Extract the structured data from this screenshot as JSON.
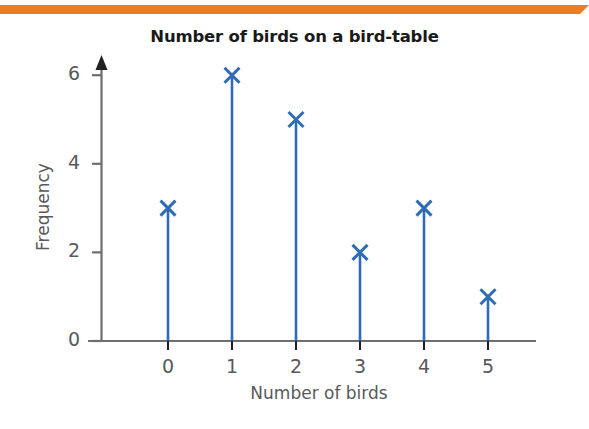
{
  "decoration": {
    "top_band_color": "#F07C22"
  },
  "chart_data": {
    "type": "bar",
    "variant": "vertical-line-with-x-markers",
    "title": "Number of birds on a bird-table",
    "xlabel": "Number of birds",
    "ylabel": "Frequency",
    "categories": [
      "0",
      "1",
      "2",
      "3",
      "4",
      "5"
    ],
    "values": [
      3,
      6,
      5,
      2,
      3,
      1
    ],
    "xtick_labels": [
      "0",
      "1",
      "2",
      "3",
      "4",
      "5"
    ],
    "ytick_labels": [
      "0",
      "2",
      "4",
      "6"
    ],
    "ytick_values": [
      0,
      2,
      4,
      6
    ],
    "ylim": [
      0,
      6.5
    ],
    "xlim": [
      -0.65,
      5.8
    ],
    "grid": false,
    "legend": null,
    "series_color": "#2E6DB4",
    "axis_color": "#6D6E71",
    "marker": "x",
    "y_axis_arrow": true
  }
}
